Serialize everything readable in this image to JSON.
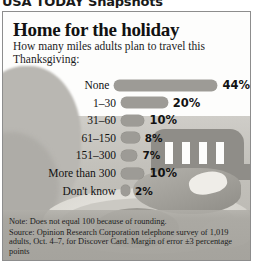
{
  "banner": {
    "text": "USA TODAY Snapshots"
  },
  "headline": "Home for the holiday",
  "subhead": "How many miles adults plan to travel this Thanksgiving:",
  "footnote": {
    "note": "Note: Does not equal 100 because of rounding.",
    "source": "Source: Opinion Research Corporation telephone survey of 1,019 adults, Oct. 4–7, for Discover Card. Margin of error ±3 percentage points"
  },
  "colors": {
    "bar": "#9d9b96",
    "panel_border": "#8d8d8d",
    "text": "#111111",
    "paper": "#fdfdfc",
    "cloth": "#c3c1bb"
  },
  "chart_data": {
    "type": "bar",
    "orientation": "horizontal",
    "title": "Home for the holiday",
    "subtitle": "How many miles adults plan to travel this Thanksgiving:",
    "xlabel": "",
    "ylabel": "",
    "xlim": [
      0,
      44
    ],
    "grid": false,
    "legend": "none",
    "unit": "%",
    "categories": [
      "None",
      "1–30",
      "31–60",
      "61–150",
      "151–300",
      "More than 300",
      "Don't know"
    ],
    "values": [
      44,
      20,
      10,
      8,
      7,
      10,
      2
    ],
    "value_labels": [
      "44%",
      "20%",
      "10%",
      "8%",
      "7%",
      "10%",
      "2%"
    ],
    "annotations": [
      "Note: Does not equal 100 because of rounding.",
      "Source: Opinion Research Corporation telephone survey of 1,019 adults, Oct. 4–7, for Discover Card. Margin of error ±3 percentage points"
    ]
  }
}
